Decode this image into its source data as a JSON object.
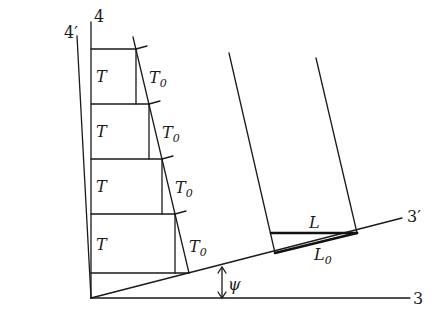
{
  "diagram": {
    "axes": {
      "axis_4": "4",
      "axis_4_prime": "4′",
      "axis_3": "3",
      "axis_3_prime": "3′"
    },
    "angle_label": "ψ",
    "cells": [
      {
        "left": "T",
        "right": "T",
        "right_sub": "0"
      },
      {
        "left": "T",
        "right": "T",
        "right_sub": "0"
      },
      {
        "left": "T",
        "right": "T",
        "right_sub": "0"
      },
      {
        "left": "T",
        "right": "T",
        "right_sub": "0"
      }
    ],
    "length_labels": {
      "L": "L",
      "L0_main": "L",
      "L0_sub": "0"
    }
  }
}
